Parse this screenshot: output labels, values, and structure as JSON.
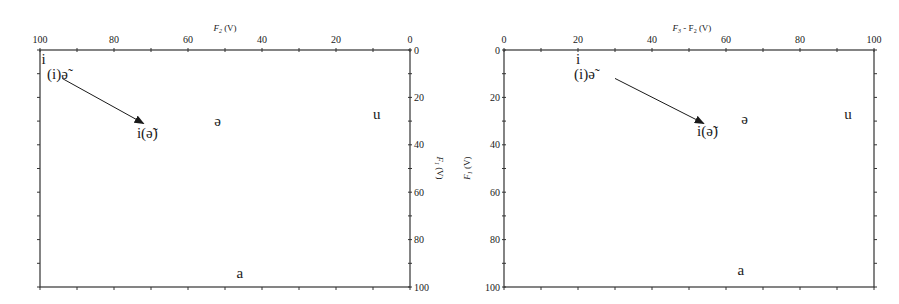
{
  "chart_data": [
    {
      "type": "scatter",
      "title": "",
      "xlabel": "F2 (V)",
      "xlabel_sub": "2",
      "xlabel_base": "F",
      "xlabel_unit": " (V)",
      "ylabel": "F1 (V)",
      "ylabel_base": "F",
      "ylabel_sub": "1",
      "ylabel_unit": " (V)",
      "x_axis_position": "top",
      "y_axis_position": "right",
      "xlim": [
        100,
        0
      ],
      "ylim": [
        0,
        100
      ],
      "x_reversed": true,
      "y_reversed": true,
      "x_ticks": [
        100,
        80,
        60,
        40,
        20,
        0
      ],
      "y_ticks": [
        0,
        20,
        40,
        60,
        80,
        100
      ],
      "grid": false,
      "points": [
        {
          "label": "i",
          "x": 99,
          "y": 4
        },
        {
          "label": "(i)ə̃",
          "x": 97,
          "y": 10
        },
        {
          "label": "i(ə̃)",
          "x": 71,
          "y": 35
        },
        {
          "label": "ə",
          "x": 52,
          "y": 30
        },
        {
          "label": "u",
          "x": 9,
          "y": 27
        },
        {
          "label": "a",
          "x": 46,
          "y": 94
        }
      ],
      "annotations": [
        {
          "type": "arrow",
          "from": "(i)ə̃",
          "to": "i(ə̃)",
          "from_xy": [
            94,
            12
          ],
          "to_xy": [
            72,
            31
          ]
        }
      ]
    },
    {
      "type": "scatter",
      "title": "",
      "xlabel": "F3 - F2 (V)",
      "xlabel_base": "F",
      "xlabel_sub": "3",
      "xlabel_mid": " - F",
      "xlabel_sub2": "2",
      "xlabel_unit": " (V)",
      "ylabel": "F1 (V)",
      "ylabel_base": "F",
      "ylabel_sub": "1",
      "ylabel_unit": " (V)",
      "x_axis_position": "top",
      "y_axis_position": "left",
      "xlim": [
        0,
        100
      ],
      "ylim": [
        0,
        100
      ],
      "x_reversed": false,
      "y_reversed": true,
      "x_ticks": [
        0,
        20,
        40,
        60,
        80,
        100
      ],
      "y_ticks": [
        0,
        20,
        40,
        60,
        80,
        100
      ],
      "grid": false,
      "points": [
        {
          "label": "i",
          "x": 20,
          "y": 4
        },
        {
          "label": "(i)ə̃",
          "x": 20,
          "y": 10
        },
        {
          "label": "i(ə̃)",
          "x": 55,
          "y": 34
        },
        {
          "label": "ə",
          "x": 65,
          "y": 29
        },
        {
          "label": "u",
          "x": 93,
          "y": 27
        },
        {
          "label": "a",
          "x": 64,
          "y": 93
        }
      ],
      "annotations": [
        {
          "type": "arrow",
          "from": "(i)ə̃",
          "to": "i(ə̃)",
          "from_xy": [
            30,
            12
          ],
          "to_xy": [
            54,
            31
          ]
        }
      ]
    }
  ]
}
